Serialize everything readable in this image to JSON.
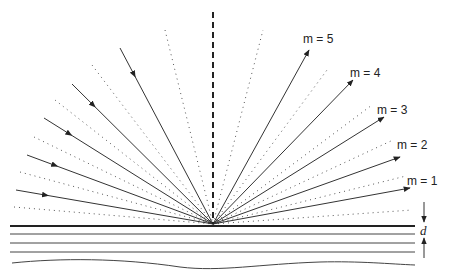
{
  "diagram": {
    "origin": {
      "x": 213,
      "y": 224
    },
    "normal_line": {
      "x1": 213,
      "y1": 12,
      "x2": 213,
      "y2": 224,
      "style": "dashed"
    },
    "incident_rays": [
      {
        "x": 120,
        "y": 48
      },
      {
        "x": 72,
        "y": 84
      },
      {
        "x": 44,
        "y": 118
      },
      {
        "x": 27,
        "y": 155
      },
      {
        "x": 16,
        "y": 190
      }
    ],
    "left_dotted_lines": [
      {
        "x": 165,
        "y": 30
      },
      {
        "x": 92,
        "y": 65
      },
      {
        "x": 55,
        "y": 100
      },
      {
        "x": 34,
        "y": 137
      },
      {
        "x": 20,
        "y": 172
      },
      {
        "x": 14,
        "y": 207
      }
    ],
    "diffracted_rays": [
      {
        "order": "m = 5",
        "x": 309,
        "y": 50,
        "label_x": 303,
        "label_y": 46
      },
      {
        "order": "m = 4",
        "x": 353,
        "y": 80,
        "label_x": 350,
        "label_y": 80
      },
      {
        "order": "m = 3",
        "x": 384,
        "y": 117,
        "label_x": 377,
        "label_y": 117
      },
      {
        "order": "m = 2",
        "x": 400,
        "y": 157,
        "label_x": 397,
        "label_y": 152
      },
      {
        "order": "m = 1",
        "x": 410,
        "y": 188,
        "label_x": 407,
        "label_y": 188
      }
    ],
    "right_dotted_lines": [
      {
        "x": 263,
        "y": 30
      },
      {
        "x": 327,
        "y": 70
      },
      {
        "x": 372,
        "y": 105
      },
      {
        "x": 393,
        "y": 140
      },
      {
        "x": 406,
        "y": 176
      },
      {
        "x": 412,
        "y": 210
      }
    ],
    "layers": {
      "surface_y": 226,
      "inner_lines_y": [
        234,
        243,
        252
      ],
      "x_start": 10,
      "x_end": 415
    },
    "spacing_label": "d",
    "colors": {
      "line": "#333333",
      "dotted": "#555555",
      "background": "#ffffff"
    }
  }
}
